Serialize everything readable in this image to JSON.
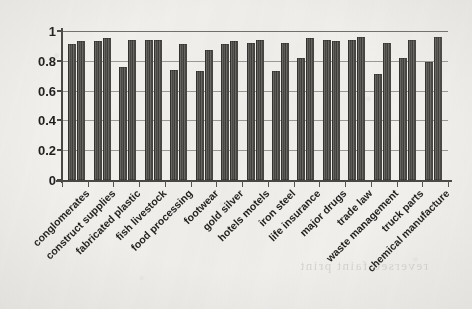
{
  "chart_data": {
    "type": "bar",
    "title": "",
    "subtitle": "",
    "xlabel": "",
    "ylabel": "",
    "ylim": [
      0,
      1
    ],
    "yticks": [
      "0",
      "0.2",
      "0.4",
      "0.6",
      "0.8",
      "1"
    ],
    "grid": true,
    "legend_position": "none",
    "grouped": true,
    "bars_per_group": 2,
    "categories": [
      "conglomerates",
      "construct supplies",
      "fabricated plastic",
      "fish livestock",
      "food processing",
      "footwear",
      "gold silver",
      "hotels motels",
      "iron steel",
      "life insurance",
      "major drugs",
      "trade law",
      "waste management",
      "truck parts",
      "chemical manufacture"
    ],
    "series": [
      {
        "name": "series-1",
        "values": [
          0.91,
          0.93,
          0.76,
          0.94,
          0.74,
          0.73,
          0.91,
          0.92,
          0.73,
          0.82,
          0.94,
          0.94,
          0.71,
          0.82,
          0.79
        ]
      },
      {
        "name": "series-2",
        "values": [
          0.93,
          0.95,
          0.94,
          0.94,
          0.91,
          0.87,
          0.93,
          0.94,
          0.92,
          0.95,
          0.93,
          0.96,
          0.92,
          0.94,
          0.96
        ]
      }
    ]
  },
  "style": {
    "bar_color": "#4a4845",
    "axis_color": "#4a4845",
    "grid_color": "#8d8b86",
    "text_color": "#1f1e1c",
    "page_color": "#f2f1ee"
  },
  "artifacts": {
    "bleed_through_text": "reversed faint print"
  }
}
